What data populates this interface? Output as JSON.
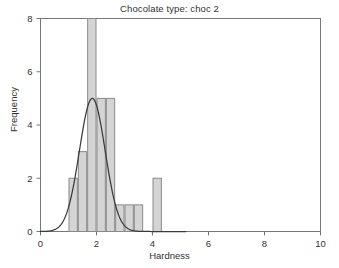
{
  "chart_data": {
    "type": "bar",
    "title": "Chocolate type: choc 2",
    "xlabel": "Hardness",
    "ylabel": "Frequency",
    "xlim": [
      0,
      10
    ],
    "ylim": [
      0,
      8
    ],
    "xticks": [
      0,
      2,
      4,
      6,
      8,
      10
    ],
    "yticks": [
      0,
      2,
      4,
      6,
      8
    ],
    "grid": false,
    "legend": null,
    "bin_width": 0.3333,
    "bin_starts": [
      1.0,
      1.3333,
      1.6667,
      2.0,
      2.3333,
      2.6667,
      3.0,
      3.3333,
      3.6667,
      4.0
    ],
    "categories": [
      "1.00-1.33",
      "1.33-1.67",
      "1.67-2.00",
      "2.00-2.33",
      "2.33-2.67",
      "2.67-3.00",
      "3.00-3.33",
      "3.33-3.67"
    ],
    "values": [
      2,
      3,
      8,
      5,
      5,
      1,
      1,
      1
    ],
    "bars": [
      {
        "start": 1.0,
        "end": 1.3333,
        "frequency": 2
      },
      {
        "start": 1.3333,
        "end": 1.6667,
        "frequency": 3
      },
      {
        "start": 1.6667,
        "end": 2.0,
        "frequency": 8
      },
      {
        "start": 2.0,
        "end": 2.3333,
        "frequency": 5
      },
      {
        "start": 2.3333,
        "end": 2.6667,
        "frequency": 5
      },
      {
        "start": 2.6667,
        "end": 3.0,
        "frequency": 1
      },
      {
        "start": 3.0,
        "end": 3.3333,
        "frequency": 1
      },
      {
        "start": 3.3333,
        "end": 3.6667,
        "frequency": 1
      },
      {
        "start": 4.0,
        "end": 4.3333,
        "frequency": 2
      }
    ],
    "overlay_curve": {
      "name": "normal density",
      "peak_x": 1.85,
      "peak_y": 5.0,
      "mean": 1.85,
      "sigma": 0.46,
      "x_start": 0.0,
      "x_end": 10.0
    },
    "colors": {
      "bar_fill": "#d4d4d4",
      "bar_stroke": "#8a8a8a",
      "curve": "#3a3a3a",
      "axis": "#777777",
      "text": "#333333",
      "background": "#ffffff"
    }
  },
  "axis_tick_labels": {
    "x": [
      "0",
      "2",
      "4",
      "6",
      "8",
      "10"
    ],
    "y": [
      "0",
      "2",
      "4",
      "6",
      "8"
    ]
  }
}
